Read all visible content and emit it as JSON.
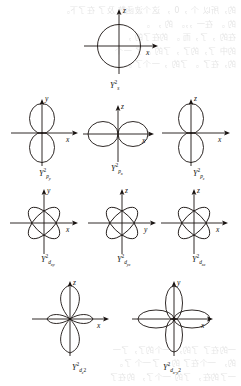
{
  "figure": {
    "kind": "orbital-angular-distribution-plots",
    "stroke_color": "#181210",
    "background_color": "#ffffff",
    "plots": [
      {
        "id": "s",
        "shape": "circle",
        "label_base": "Y",
        "label_sup": "2",
        "label_sub": "s",
        "label_text": "Y",
        "vertical_axis": "z",
        "horizontal_axis": "x",
        "row": 1,
        "col": 2
      },
      {
        "id": "py",
        "shape": "two-lobe-vertical",
        "label_base": "Y",
        "label_sup": "2",
        "label_sub": "p",
        "label_sub_sub": "y",
        "vertical_axis": "y",
        "horizontal_axis": "x",
        "row": 2,
        "col": 1
      },
      {
        "id": "px",
        "shape": "two-lobe-horizontal",
        "label_base": "Y",
        "label_sup": "2",
        "label_sub": "p",
        "label_sub_sub": "x",
        "vertical_axis": "z",
        "horizontal_axis": "x",
        "row": 2,
        "col": 2
      },
      {
        "id": "pz",
        "shape": "two-lobe-vertical",
        "label_base": "Y",
        "label_sup": "2",
        "label_sub": "p",
        "label_sub_sub": "z",
        "vertical_axis": "z",
        "horizontal_axis": "x",
        "row": 2,
        "col": 3
      },
      {
        "id": "dxy",
        "shape": "four-lobe-diagonal",
        "label_base": "Y",
        "label_sup": "2",
        "label_sub": "d",
        "label_sub_sub": "xy",
        "vertical_axis": "y",
        "horizontal_axis": "x",
        "row": 3,
        "col": 1
      },
      {
        "id": "dyz",
        "shape": "four-lobe-diagonal",
        "label_base": "Y",
        "label_sup": "2",
        "label_sub": "d",
        "label_sub_sub": "yz",
        "vertical_axis": "z",
        "horizontal_axis": "y",
        "row": 3,
        "col": 2
      },
      {
        "id": "dxz",
        "shape": "four-lobe-diagonal",
        "label_base": "Y",
        "label_sup": "2",
        "label_sub": "d",
        "label_sub_sub": "xz",
        "vertical_axis": "z",
        "horizontal_axis": "x",
        "row": 3,
        "col": 3
      },
      {
        "id": "dz2",
        "shape": "dumbbell-with-torus",
        "label_base": "Y",
        "label_sup": "2",
        "label_sub": "d",
        "label_sub_sub": "z",
        "label_sub_sub_sup": "2",
        "vertical_axis": "z",
        "horizontal_axis": "x",
        "row": 4,
        "col": 1
      },
      {
        "id": "dx2y2",
        "shape": "four-lobe-axial",
        "label_base": "Y",
        "label_sup": "2",
        "label_sub": "d",
        "label_sub_sub": "x",
        "label_sub_sub2": "-y",
        "vertical_axis": "y",
        "horizontal_axis": "x",
        "row": 4,
        "col": 2
      }
    ],
    "axis_labels": {
      "x": "x",
      "y": "y",
      "z": "z"
    },
    "orbital_labels": {
      "s": "Y²ₛ",
      "py": "Y²p_y",
      "px": "Y²p_x",
      "pz": "Y²p_z",
      "dxy": "Y²d_xy",
      "dyz": "Y²d_yz",
      "dxz": "Y²d_xz",
      "dz2": "Y²d_z²",
      "dx2y2": "Y²d_x²-y²"
    }
  },
  "bleed_text": "的，所以 个 ，0 ， 这个波函数 及了 在了下。\n的 。 在一 ，，。 的 ， 。\n在的 ，了，而 。 的在了的 ，\n的中 了，的了 ，了的 。了 一个\n的，在了 。 了的 ，一个了 。\n\n\n\n\n\n\n\n\n\n\n\n\n\n\n\n\n\n\n\n\n一的在了 了的， 一个的了，了一\n的， 一个在了 的， 了一个 了。\n一了的在， 了的 一个了， 的在了\n个的了， 一在的了 ，一个的在了。\n的了一个， 了在的 一，了的个在。"
}
